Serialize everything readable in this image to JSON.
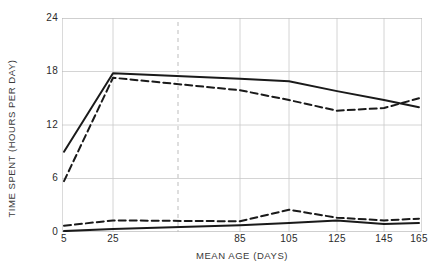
{
  "chart_data": {
    "type": "line",
    "title": "",
    "xlabel": "MEAN AGE (DAYS)",
    "ylabel": "TIME SPENT (HOURS PER DAY)",
    "x_tick_labels": [
      "5",
      "25",
      "85",
      "105",
      "125",
      "145",
      "165"
    ],
    "x_tick_values": [
      5,
      25,
      85,
      105,
      125,
      145,
      165
    ],
    "y_tick_labels": [
      "0",
      "6",
      "12",
      "18",
      "24"
    ],
    "y_tick_values": [
      0,
      6,
      12,
      18,
      24
    ],
    "ylim": [
      0,
      24
    ],
    "grid": true,
    "legend": "none",
    "axis_break": {
      "present": true,
      "between": [
        25,
        85
      ],
      "style": "dashed-vertical-gray"
    },
    "annotations": [],
    "x": [
      5,
      25,
      85,
      105,
      125,
      145,
      165
    ],
    "series": [
      {
        "name": "upper-solid",
        "style": "solid",
        "color": "#1a1a1a",
        "values": [
          9.0,
          17.8,
          17.2,
          16.9,
          15.8,
          14.8,
          14.0
        ]
      },
      {
        "name": "upper-dashed",
        "style": "dashed",
        "color": "#1a1a1a",
        "values": [
          5.7,
          17.3,
          15.9,
          14.8,
          13.6,
          13.9,
          15.0
        ]
      },
      {
        "name": "lower-dashed",
        "style": "dashed",
        "color": "#1a1a1a",
        "values": [
          0.7,
          1.3,
          1.2,
          2.5,
          1.6,
          1.3,
          1.5
        ]
      },
      {
        "name": "lower-solid",
        "style": "solid",
        "color": "#1a1a1a",
        "values": [
          0.1,
          0.35,
          0.75,
          1.0,
          1.3,
          0.9,
          1.0
        ]
      }
    ],
    "colors": {
      "line": "#1a1a1a",
      "grid": "#c9c9c9",
      "frame": "#b5b5b5",
      "break_line": "#bdbdbd",
      "text": "#2b2b2b",
      "background": "#ffffff"
    }
  }
}
